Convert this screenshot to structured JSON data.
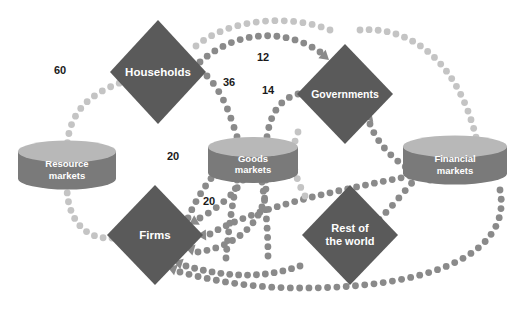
{
  "diagram": {
    "kind": "circular-flow-of-expenditure-and-income",
    "background_color": "#ffffff",
    "palette": {
      "diamond_fill": "#5a5a5a",
      "cylinder_body": "#7a7a7a",
      "cylinder_top": "#b8b8b8",
      "flow_dark": "#8a8a8a",
      "flow_light": "#c4c4c4",
      "label_text": "#1a1a1a",
      "node_text": "#ffffff"
    },
    "nodes": [
      {
        "id": "households",
        "label": "Households",
        "shape": "diamond",
        "cx": 158,
        "cy": 72,
        "rx": 48,
        "ry": 52,
        "fill": "#5a5a5a",
        "font_size": 11.5
      },
      {
        "id": "governments",
        "label": "Governments",
        "shape": "diamond",
        "cx": 345,
        "cy": 94,
        "rx": 48,
        "ry": 50,
        "fill": "#5a5a5a",
        "font_size": 10.5
      },
      {
        "id": "firms",
        "label": "Firms",
        "shape": "diamond",
        "cx": 155,
        "cy": 235,
        "rx": 48,
        "ry": 50,
        "fill": "#5a5a5a",
        "font_size": 11.5
      },
      {
        "id": "rest-of-the-world",
        "label": "Rest of\nthe world",
        "shape": "diamond",
        "cx": 350,
        "cy": 235,
        "rx": 48,
        "ry": 50,
        "fill": "#5a5a5a",
        "font_size": 11
      },
      {
        "id": "resource-markets",
        "label": "Resource\nmarkets",
        "shape": "cylinder",
        "cx": 67,
        "cy": 165,
        "rx": 49,
        "ry": 11,
        "h": 27,
        "font_size": 9.5
      },
      {
        "id": "goods-markets",
        "label": "Goods\nmarkets",
        "shape": "cylinder",
        "cx": 253,
        "cy": 160,
        "rx": 45,
        "ry": 10,
        "h": 26,
        "font_size": 9.5
      },
      {
        "id": "financial-markets",
        "label": "Financial\nmarkets",
        "shape": "cylinder",
        "cx": 455,
        "cy": 160,
        "rx": 52,
        "ry": 11,
        "h": 27,
        "font_size": 9.5
      }
    ],
    "flow_values": [
      {
        "id": "flow-value-60",
        "value": "60",
        "x": 60,
        "y": 74,
        "from": "resource-markets",
        "to": "households"
      },
      {
        "id": "flow-value-12",
        "value": "12",
        "x": 263,
        "y": 61,
        "from": "households",
        "to": "governments"
      },
      {
        "id": "flow-value-36",
        "value": "36",
        "x": 229,
        "y": 86,
        "from": "households",
        "to": "goods-markets"
      },
      {
        "id": "flow-value-14",
        "value": "14",
        "x": 268,
        "y": 94,
        "from": "governments",
        "to": "goods-markets"
      },
      {
        "id": "flow-value-20-upper",
        "value": "20",
        "x": 173,
        "y": 160,
        "from": "firms",
        "to": "resource-markets"
      },
      {
        "id": "flow-value-20-lower",
        "value": "20",
        "x": 209,
        "y": 205,
        "from": "goods-markets",
        "to": "firms"
      }
    ],
    "flow_paths": [
      {
        "id": "flow-resource-to-households",
        "d": "M 67,152 C 67,110 92,92 128,80",
        "tone": "light",
        "arrow": {
          "x": 131,
          "y": 74,
          "angle": 10
        }
      },
      {
        "id": "flow-households-to-governments-outer",
        "d": "M 196,46 C 230,18 290,14 330,30",
        "tone": "light",
        "arrow": null
      },
      {
        "id": "flow-households-to-governments-inner",
        "d": "M 200,62 C 236,30 285,28 320,52",
        "tone": "dark",
        "arrow": {
          "x": 322,
          "y": 54,
          "angle": 40
        }
      },
      {
        "id": "flow-households-to-goods-markets",
        "d": "M 207,76 C 226,96 232,122 240,146",
        "tone": "dark",
        "arrow": {
          "x": 241,
          "y": 149,
          "angle": 75
        }
      },
      {
        "id": "flow-governments-to-goods-markets",
        "d": "M 298,94 C 276,100 268,120 266,146",
        "tone": "dark",
        "arrow": {
          "x": 266,
          "y": 149,
          "angle": 88
        }
      },
      {
        "id": "flow-goods-markets-third-inflow",
        "d": "M 188,218 C 200,190 216,170 236,152",
        "tone": "dark",
        "arrow": {
          "x": 253,
          "y": 149,
          "angle": 80
        }
      },
      {
        "id": "flow-firms-to-resource-markets",
        "d": "M 112,238 C 80,240 66,212 67,184",
        "tone": "light",
        "arrow": {
          "x": 67,
          "y": 180,
          "angle": -90
        }
      },
      {
        "id": "flow-goods-markets-to-firms",
        "d": "M 243,180 C 232,196 218,208 200,218",
        "tone": "dark",
        "arrow": {
          "x": 197,
          "y": 220,
          "angle": 150
        }
      },
      {
        "id": "flow-financial-to-firms",
        "d": "M 410,176 C 330,192 260,206 210,234",
        "tone": "dark",
        "arrow": {
          "x": 206,
          "y": 235,
          "angle": 178
        }
      },
      {
        "id": "flow-goods-to-firms-lower",
        "d": "M 266,180 C 268,218 240,246 198,252",
        "tone": "dark",
        "arrow": {
          "x": 194,
          "y": 250,
          "angle": 196
        }
      },
      {
        "id": "flow-row-to-firms",
        "d": "M 300,266 C 260,280 222,276 186,266",
        "tone": "dark",
        "arrow": {
          "x": 182,
          "y": 264,
          "angle": 198
        }
      },
      {
        "id": "flow-financial-bottom-to-firms",
        "d": "M 500,190 C 512,250 440,288 300,288 C 250,288 210,280 180,272",
        "tone": "dark",
        "arrow": {
          "x": 176,
          "y": 270,
          "angle": 200
        }
      },
      {
        "id": "flow-governments-top-to-financial",
        "d": "M 360,30 C 410,26 460,60 478,146",
        "tone": "light",
        "arrow": null
      },
      {
        "id": "flow-financial-to-governments",
        "d": "M 430,180 C 400,168 378,146 370,124",
        "tone": "dark",
        "arrow": {
          "x": 368,
          "y": 120,
          "angle": -70
        }
      },
      {
        "id": "flow-financial-to-row",
        "d": "M 418,176 C 400,196 388,212 372,226",
        "tone": "dark",
        "arrow": {
          "x": 369,
          "y": 229,
          "angle": 135
        }
      },
      {
        "id": "flow-goods-markets-down-left",
        "d": "M 237,180 C 232,206 228,232 226,258",
        "tone": "dark",
        "arrow": null
      },
      {
        "id": "flow-goods-markets-down-right",
        "d": "M 262,182 C 266,208 268,232 268,256",
        "tone": "dark",
        "arrow": null
      },
      {
        "id": "flow-row-left-feeder",
        "d": "M 305,196 C 292,172 290,152 298,132",
        "tone": "light",
        "arrow": null
      }
    ]
  }
}
